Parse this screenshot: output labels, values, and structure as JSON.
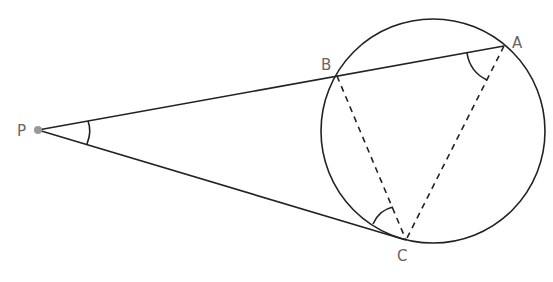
{
  "diagram": {
    "type": "geometry",
    "points": {
      "P": {
        "label": "P",
        "x": 38,
        "y": 130
      },
      "B": {
        "label": "B",
        "x": 337,
        "y": 76
      },
      "A": {
        "label": "A",
        "x": 504,
        "y": 46
      },
      "C": {
        "label": "C",
        "x": 406,
        "y": 240
      }
    },
    "circle": {
      "cx": 433,
      "cy": 131,
      "r": 112
    },
    "segments": [
      {
        "from": "P",
        "to": "A",
        "style": "solid"
      },
      {
        "from": "P",
        "to": "C",
        "style": "solid"
      },
      {
        "from": "B",
        "to": "C",
        "style": "dashed"
      },
      {
        "from": "A",
        "to": "C",
        "style": "dashed"
      }
    ],
    "marked_angles": [
      "BPC",
      "BAC",
      "PCB"
    ],
    "colors": {
      "line": "#222222",
      "label": "#666666",
      "point": "#999999"
    }
  }
}
